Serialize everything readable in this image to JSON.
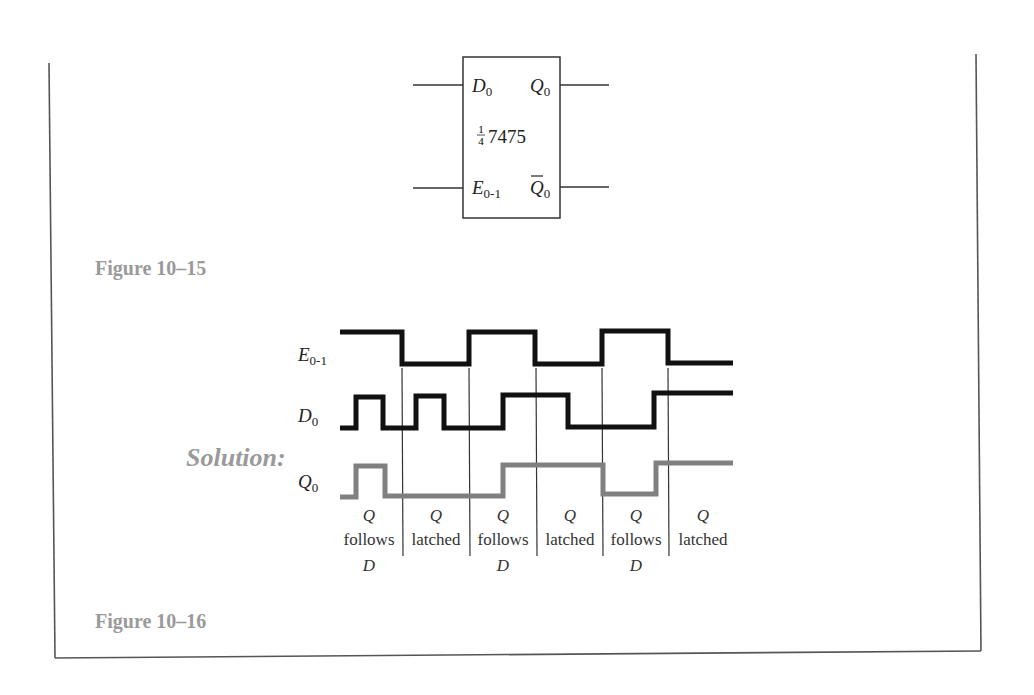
{
  "figure_10_15": {
    "caption": "Figure 10–15",
    "chip_label_fraction_num": "1",
    "chip_label_fraction_den": "4",
    "chip_label": "7475",
    "pins": {
      "d": {
        "main": "D",
        "sub": "0"
      },
      "q": {
        "main": "Q",
        "sub": "0"
      },
      "e": {
        "main": "E",
        "sub": "0-1"
      },
      "qbar": {
        "main": "Q",
        "sub": "0"
      }
    }
  },
  "figure_10_16": {
    "caption": "Figure 10–16",
    "solution_label": "Solution:",
    "signals": [
      {
        "name": "E",
        "sub": "0-1",
        "color": "#111111"
      },
      {
        "name": "D",
        "sub": "0",
        "color": "#111111"
      },
      {
        "name": "Q",
        "sub": "0",
        "color": "#808080"
      }
    ],
    "intervals": [
      {
        "top": "Q",
        "middle": "follows",
        "bottom": "D"
      },
      {
        "top": "Q",
        "middle": "latched",
        "bottom": ""
      },
      {
        "top": "Q",
        "middle": "follows",
        "bottom": "D"
      },
      {
        "top": "Q",
        "middle": "latched",
        "bottom": ""
      },
      {
        "top": "Q",
        "middle": "follows",
        "bottom": "D"
      },
      {
        "top": "Q",
        "middle": "latched",
        "bottom": ""
      }
    ]
  },
  "colors": {
    "border": "#555555",
    "caption": "#9a9a9a",
    "waveform": "#111111",
    "output_waveform": "#808080"
  }
}
